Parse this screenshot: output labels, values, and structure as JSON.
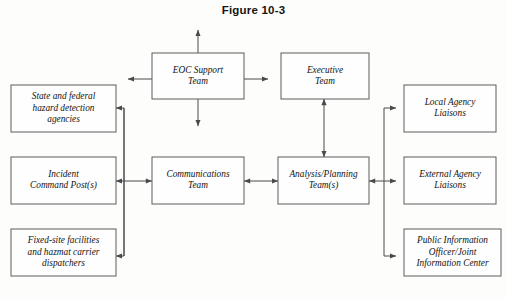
{
  "figure": {
    "title": "Figure 10-3"
  },
  "diagram": {
    "type": "flowchart",
    "orientation": "horizontal",
    "nodes": [
      {
        "id": "state-federal-hazard",
        "lines": [
          "State and federal",
          "hazard detection",
          "agencies"
        ],
        "x": 11,
        "y": 85,
        "w": 105,
        "h": 47,
        "column": "left",
        "row": 1
      },
      {
        "id": "incident-command-post",
        "lines": [
          "Incident",
          "Command Post(s)"
        ],
        "x": 11,
        "y": 157,
        "w": 105,
        "h": 47,
        "column": "left",
        "row": 2
      },
      {
        "id": "fixed-site-facilities",
        "lines": [
          "Fixed-site facilities",
          "and hazmat carrier",
          "dispatchers"
        ],
        "x": 11,
        "y": 229,
        "w": 105,
        "h": 47,
        "column": "left",
        "row": 3
      },
      {
        "id": "eoc-support-team",
        "lines": [
          "EOC Support",
          "Team"
        ],
        "x": 152,
        "y": 53,
        "w": 92,
        "h": 46,
        "column": "center",
        "row": 0
      },
      {
        "id": "communications-team",
        "lines": [
          "Communications",
          "Team"
        ],
        "x": 152,
        "y": 157,
        "w": 92,
        "h": 47,
        "column": "center",
        "row": 2
      },
      {
        "id": "executive-team",
        "lines": [
          "Executive",
          "Team"
        ],
        "x": 281,
        "y": 53,
        "w": 88,
        "h": 46,
        "column": "center-right",
        "row": 0
      },
      {
        "id": "analysis-planning-team",
        "lines": [
          "Analysis/Planning",
          "Team(s)"
        ],
        "x": 278,
        "y": 157,
        "w": 91,
        "h": 47,
        "column": "center-right",
        "row": 2
      },
      {
        "id": "local-agency-liaisons",
        "lines": [
          "Local Agency",
          "Liaisons"
        ],
        "x": 404,
        "y": 85,
        "w": 92,
        "h": 47,
        "column": "right",
        "row": 1
      },
      {
        "id": "external-agency-liaisons",
        "lines": [
          "External Agency",
          "Liaisons"
        ],
        "x": 404,
        "y": 157,
        "w": 92,
        "h": 47,
        "column": "right",
        "row": 2
      },
      {
        "id": "public-information-officer",
        "lines": [
          "Public Information",
          "Officer/Joint",
          "Information Center"
        ],
        "x": 404,
        "y": 229,
        "w": 97,
        "h": 47,
        "column": "right",
        "row": 3
      }
    ],
    "edges": [
      {
        "id": "eoc-arrow-up",
        "from": "eoc-support-team",
        "to": "external",
        "direction": "up",
        "arrow": "single"
      },
      {
        "id": "eoc-arrow-down",
        "from": "eoc-support-team",
        "to": "external",
        "direction": "down",
        "arrow": "single"
      },
      {
        "id": "eoc-arrow-left",
        "from": "eoc-support-team",
        "to": "external",
        "direction": "left",
        "arrow": "single"
      },
      {
        "id": "eoc-arrow-right",
        "from": "eoc-support-team",
        "to": "external",
        "direction": "right",
        "arrow": "single"
      },
      {
        "id": "executive-to-analysis",
        "from": "executive-team",
        "to": "analysis-planning-team",
        "direction": "vertical",
        "arrow": "double"
      },
      {
        "id": "communications-to-analysis",
        "from": "communications-team",
        "to": "analysis-planning-team",
        "direction": "horizontal",
        "arrow": "double"
      },
      {
        "id": "communications-to-left-trunk",
        "from": "communications-team",
        "to": "left-trunk",
        "direction": "horizontal",
        "arrow": "double"
      },
      {
        "id": "left-trunk-to-state-federal",
        "from": "left-trunk",
        "to": "state-federal-hazard",
        "direction": "left",
        "arrow": "single"
      },
      {
        "id": "left-trunk-to-incident-command",
        "from": "left-trunk",
        "to": "incident-command-post",
        "direction": "left",
        "arrow": "single"
      },
      {
        "id": "left-trunk-to-fixed-site",
        "from": "left-trunk",
        "to": "fixed-site-facilities",
        "direction": "left",
        "arrow": "single"
      },
      {
        "id": "analysis-to-right-trunk",
        "from": "analysis-planning-team",
        "to": "right-trunk",
        "direction": "horizontal",
        "arrow": "double"
      },
      {
        "id": "right-trunk-to-local-agency",
        "from": "right-trunk",
        "to": "local-agency-liaisons",
        "direction": "right",
        "arrow": "single"
      },
      {
        "id": "right-trunk-to-external-agency",
        "from": "right-trunk",
        "to": "external-agency-liaisons",
        "direction": "right",
        "arrow": "single"
      },
      {
        "id": "right-trunk-to-public-information",
        "from": "right-trunk",
        "to": "public-information-officer",
        "direction": "right",
        "arrow": "single"
      }
    ],
    "colors": {
      "box_fill": "#fefefe",
      "box_stroke": "#5c5c5c",
      "connector": "#4a4a4a",
      "text": "#121212",
      "background": "#fdfdfb"
    }
  }
}
